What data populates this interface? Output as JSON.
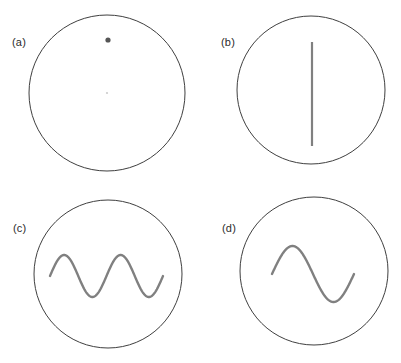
{
  "figure": {
    "width": 401,
    "height": 363,
    "background": "#ffffff",
    "circle_stroke_color": "#3f3f3f",
    "circle_fill_color": "#ffffff",
    "circle_stroke_width": 1,
    "stimulus_color": "#808080",
    "dot_color": "#555555",
    "label_color": "#2b2b2b",
    "label_font_size": 11
  },
  "panels": [
    {
      "id": "a",
      "label": "(a)",
      "label_x": 12,
      "label_y": 37,
      "circle": {
        "cx": 107,
        "cy": 93,
        "r": 78
      },
      "stimulus": {
        "type": "dot",
        "name": "point-dot",
        "cx": 108,
        "cy": 40,
        "r": 2.6,
        "color": "#555555"
      },
      "center_mark": {
        "type": "fixation-mark",
        "cx": 107,
        "cy": 93,
        "r": 1.1,
        "color": "#cccccc"
      }
    },
    {
      "id": "b",
      "label": "(b)",
      "label_x": 221,
      "label_y": 37,
      "circle": {
        "cx": 311,
        "cy": 90,
        "r": 74
      },
      "stimulus": {
        "type": "vertical-line",
        "name": "vertical-bar",
        "x": 312,
        "y1": 42,
        "y2": 146,
        "width": 2.2,
        "color": "#808080"
      }
    },
    {
      "id": "c",
      "label": "(c)",
      "label_x": 13,
      "label_y": 223,
      "circle": {
        "cx": 108,
        "cy": 274,
        "r": 74
      },
      "stimulus": {
        "type": "sine-wave",
        "name": "sine-wave-two-cycles",
        "x_start": 50,
        "x_end": 163,
        "baseline_y": 276,
        "amplitude": 21,
        "cycles": 2,
        "phase_deg": 0,
        "width": 2.4,
        "color": "#808080"
      }
    },
    {
      "id": "d",
      "label": "(d)",
      "label_x": 222,
      "label_y": 223,
      "circle": {
        "cx": 314,
        "cy": 271,
        "r": 74
      },
      "stimulus": {
        "type": "sine-wave",
        "name": "sine-wave-one-cycle",
        "x_start": 272,
        "x_end": 354,
        "baseline_y": 274,
        "amplitude": 28,
        "cycles": 1,
        "phase_deg": 0,
        "width": 2.4,
        "color": "#808080"
      }
    }
  ]
}
